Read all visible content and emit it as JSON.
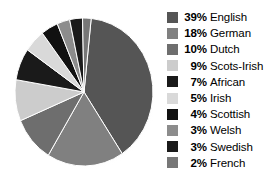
{
  "chart_data": {
    "type": "pie",
    "title": "",
    "subtitle": "",
    "xlabel": "",
    "ylabel": "",
    "legend_position": "right",
    "grid": false,
    "categories": [
      "English",
      "German",
      "Dutch",
      "Scots-Irish",
      "African",
      "Irish",
      "Scottish",
      "Welsh",
      "Swedish",
      "French"
    ],
    "values": [
      39,
      18,
      10,
      9,
      7,
      5,
      4,
      3,
      3,
      2
    ],
    "value_suffix": "%",
    "colors": [
      "#555555",
      "#808080",
      "#6e6e6e",
      "#cccccc",
      "#1a1a1a",
      "#d9d9d9",
      "#111111",
      "#8c8c8c",
      "#1a1a1a",
      "#777777"
    ],
    "slices": [
      {
        "label": "English",
        "value": 39,
        "pct_label": "39%",
        "color": "#555555"
      },
      {
        "label": "German",
        "value": 18,
        "pct_label": "18%",
        "color": "#808080"
      },
      {
        "label": "Dutch",
        "value": 10,
        "pct_label": "10%",
        "color": "#6e6e6e"
      },
      {
        "label": "Scots-Irish",
        "value": 9,
        "pct_label": "9%",
        "color": "#cccccc"
      },
      {
        "label": "African",
        "value": 7,
        "pct_label": "7%",
        "color": "#1a1a1a"
      },
      {
        "label": "Irish",
        "value": 5,
        "pct_label": "5%",
        "color": "#d9d9d9"
      },
      {
        "label": "Scottish",
        "value": 4,
        "pct_label": "4%",
        "color": "#111111"
      },
      {
        "label": "Welsh",
        "value": 3,
        "pct_label": "3%",
        "color": "#8c8c8c"
      },
      {
        "label": "Swedish",
        "value": 3,
        "pct_label": "3%",
        "color": "#1a1a1a"
      },
      {
        "label": "French",
        "value": 2,
        "pct_label": "2%",
        "color": "#777777"
      }
    ]
  },
  "legend": {
    "rows": [
      {
        "pct": "39%",
        "label": "English",
        "color": "#555555"
      },
      {
        "pct": "18%",
        "label": "German",
        "color": "#808080"
      },
      {
        "pct": "10%",
        "label": "Dutch",
        "color": "#6e6e6e"
      },
      {
        "pct": "9%",
        "label": "Scots-Irish",
        "color": "#cccccc"
      },
      {
        "pct": "7%",
        "label": "African",
        "color": "#1a1a1a"
      },
      {
        "pct": "5%",
        "label": "Irish",
        "color": "#d9d9d9"
      },
      {
        "pct": "4%",
        "label": "Scottish",
        "color": "#111111"
      },
      {
        "pct": "3%",
        "label": "Welsh",
        "color": "#8c8c8c"
      },
      {
        "pct": "3%",
        "label": "Swedish",
        "color": "#1a1a1a"
      },
      {
        "pct": "2%",
        "label": "French",
        "color": "#777777"
      }
    ]
  },
  "pie_geometry": {
    "cx": 84,
    "cy": 92,
    "rx": 69,
    "ry": 74,
    "start_angle_deg": -84
  }
}
